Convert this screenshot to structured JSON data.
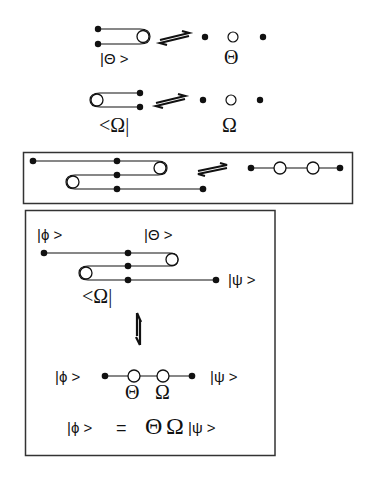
{
  "row1": {
    "ket_label": "|Θ >",
    "symbol": "Θ"
  },
  "row2": {
    "bra_label": "<Ω|",
    "symbol": "Ω"
  },
  "box2": {
    "phi_label": "|ϕ >",
    "theta_label": "|Θ >",
    "psi_label": "|ψ >",
    "omega_label": "<Ω|",
    "bottom_phi": "|ϕ >",
    "bottom_psi": "|ψ >",
    "theta": "Θ",
    "omega": "Ω",
    "equation": {
      "lhs": "|ϕ >",
      "equals": "=",
      "theta": "Θ",
      "omega": "Ω",
      "rhs": "|ψ >"
    }
  },
  "colors": {
    "ink": "#111111",
    "frame": "#333333",
    "background": "#ffffff"
  }
}
